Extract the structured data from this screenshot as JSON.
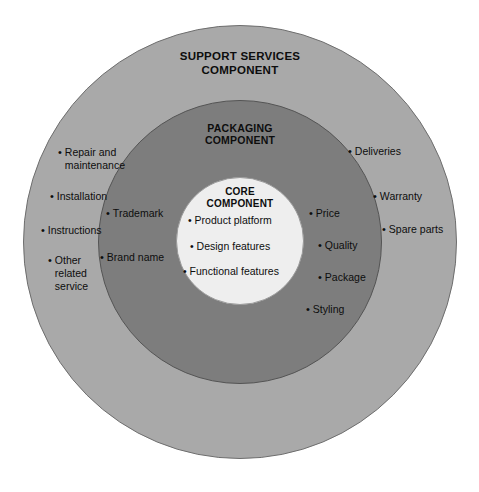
{
  "diagram": {
    "kind": "concentric-circles-product-levels-diagram",
    "colors": {
      "outer_ring": "#a9a9a9",
      "middle_ring": "#7d7d7d",
      "inner_circle": "#eeeeee",
      "text": "#0d0d0d",
      "background": "#ffffff"
    },
    "rings": {
      "outer": {
        "title": "SUPPORT SERVICES\nCOMPONENT",
        "title_line1": "SUPPORT SERVICES",
        "title_line2": "COMPONENT"
      },
      "middle": {
        "title": "PACKAGING\nCOMPONENT",
        "title_line1": "PACKAGING",
        "title_line2": "COMPONENT"
      },
      "inner": {
        "title": "CORE\nCOMPONENT",
        "title_line1": "CORE",
        "title_line2": "COMPONENT"
      }
    },
    "outer_items_left": [
      {
        "text": "Repair and\nmaintenance"
      },
      {
        "text": "Installation"
      },
      {
        "text": "Instructions"
      },
      {
        "text": "Other\nrelated\nservice"
      }
    ],
    "outer_items_right": [
      {
        "text": "Deliveries"
      },
      {
        "text": "Warranty"
      },
      {
        "text": "Spare parts"
      }
    ],
    "middle_items_left": [
      {
        "text": "Trademark"
      },
      {
        "text": "Brand name"
      }
    ],
    "middle_items_right": [
      {
        "text": "Price"
      },
      {
        "text": "Quality"
      },
      {
        "text": "Package"
      },
      {
        "text": "Styling"
      }
    ],
    "core_items": [
      {
        "text": "Product platform"
      },
      {
        "text": "Design features"
      },
      {
        "text": "Functional features"
      }
    ],
    "bullet_glyph": "•"
  }
}
